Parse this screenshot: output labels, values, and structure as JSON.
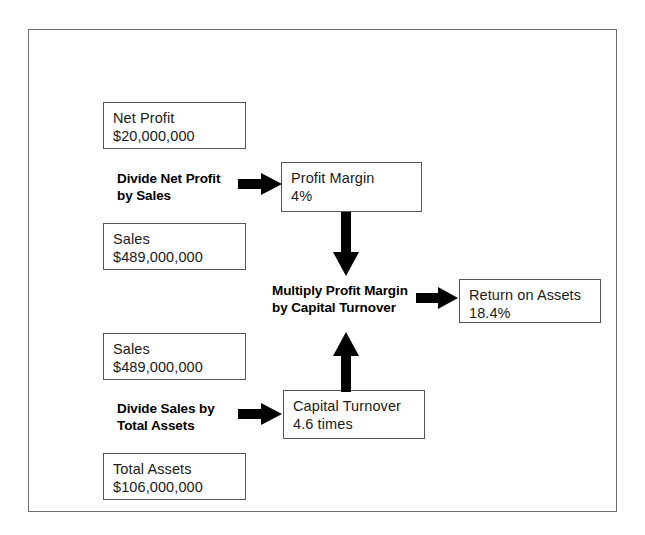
{
  "figure": {
    "border_color": "#6d6d6d",
    "node_border_color": "#555555",
    "arrow_color": "#000000",
    "background": "#ffffff"
  },
  "nodes": {
    "net_profit": {
      "label": "Net Profit",
      "value": "$20,000,000"
    },
    "sales_top": {
      "label": "Sales",
      "value": "$489,000,000"
    },
    "sales_bottom": {
      "label": "Sales",
      "value": "$489,000,000"
    },
    "total_assets": {
      "label": "Total Assets",
      "value": "$106,000,000"
    },
    "profit_margin": {
      "label": "Profit Margin",
      "value": "4%"
    },
    "capital_turnover": {
      "label": "Capital Turnover",
      "value": "4.6 times"
    },
    "return_on_assets": {
      "label": "Return on Assets",
      "value": "18.4%"
    }
  },
  "operations": {
    "divide_net_profit": {
      "line1": "Divide Net Profit",
      "line2": "by Sales"
    },
    "divide_sales": {
      "line1": "Divide Sales by",
      "line2": "Total Assets"
    },
    "multiply": {
      "line1": "Multiply Profit Margin",
      "line2": "by Capital Turnover"
    }
  },
  "arrows": {
    "net_profit_to_margin": "arrow-right-icon",
    "sales_to_turnover": "arrow-right-icon",
    "margin_down": "arrow-down-icon",
    "turnover_up": "arrow-up-icon",
    "multiply_to_roa": "arrow-right-icon"
  }
}
